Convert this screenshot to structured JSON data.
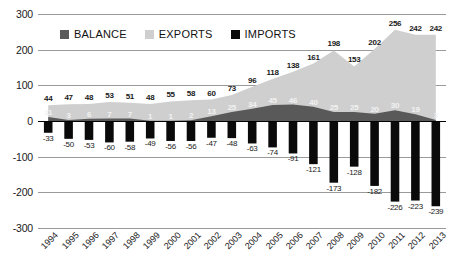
{
  "chart_data": {
    "type": "area",
    "title": "",
    "subtitle": "",
    "xlabel": "",
    "ylabel": "",
    "ylim": [
      -300,
      300
    ],
    "grid": true,
    "legend_position": "top",
    "yticks": [
      "300",
      "200",
      "100",
      "0",
      "-100",
      "-200",
      "-300"
    ],
    "ytick_values": [
      300,
      200,
      100,
      0,
      -100,
      -200,
      -300
    ],
    "categories": [
      "1994",
      "1995",
      "1996",
      "1997",
      "1998",
      "1999",
      "2000",
      "2001",
      "2002",
      "2003",
      "2004",
      "2005",
      "2006",
      "2007",
      "2008",
      "2009",
      "2010",
      "2011",
      "2012",
      "2013"
    ],
    "series": [
      {
        "name": "BALANCE",
        "color": "#595959",
        "values": [
          11,
          3,
          6,
          7,
          7,
          1,
          1,
          2,
          13,
          25,
          34,
          45,
          46,
          40,
          25,
          25,
          20,
          30,
          19,
          3
        ]
      },
      {
        "name": "EXPORTS",
        "color": "#cfcfcf",
        "values": [
          44,
          47,
          48,
          53,
          51,
          48,
          55,
          58,
          60,
          73,
          96,
          118,
          138,
          161,
          198,
          153,
          202,
          256,
          242,
          242
        ]
      },
      {
        "name": "IMPORTS",
        "color": "#0a0a0a",
        "values": [
          -33,
          -50,
          -53,
          -60,
          -58,
          -49,
          -56,
          -56,
          -47,
          -48,
          -63,
          -74,
          -91,
          -121,
          -173,
          -128,
          -182,
          -226,
          -223,
          -239
        ]
      }
    ]
  },
  "legend": {
    "items": [
      {
        "label": "BALANCE",
        "color": "#595959"
      },
      {
        "label": "EXPORTS",
        "color": "#cfcfcf"
      },
      {
        "label": "IMPORTS",
        "color": "#0a0a0a"
      }
    ]
  }
}
